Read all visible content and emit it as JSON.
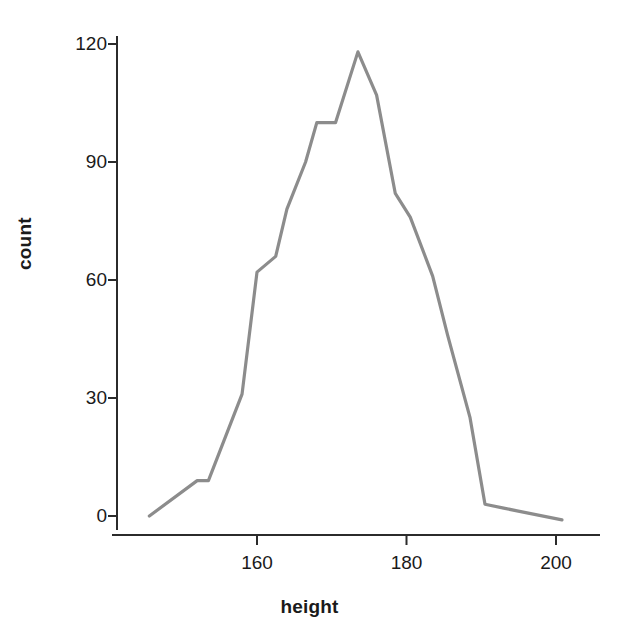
{
  "chart_data": {
    "type": "line",
    "title": "",
    "subtitle": "",
    "xlabel": "height",
    "ylabel": "count",
    "xlim": [
      144,
      202
    ],
    "ylim": [
      -2,
      122
    ],
    "grid": false,
    "legend": null,
    "line_color": "#8c8c8c",
    "axis_color": "#2b2b2b",
    "x_ticks": [
      160,
      180,
      200
    ],
    "y_ticks": [
      0,
      30,
      60,
      90,
      120
    ],
    "x_tick_labels": [
      "160",
      "180",
      "200"
    ],
    "y_tick_labels": [
      "0",
      "30",
      "60",
      "90",
      "120"
    ],
    "x": [
      145.6,
      152.0,
      153.5,
      158.0,
      160.0,
      162.5,
      164.0,
      166.5,
      168.0,
      170.5,
      173.5,
      176.0,
      178.5,
      180.5,
      183.5,
      185.5,
      188.5,
      190.5,
      193.0,
      200.8
    ],
    "values": [
      0,
      9,
      9,
      31,
      62,
      66,
      78,
      90,
      100,
      100,
      118,
      107,
      82,
      76,
      61,
      46,
      25,
      3,
      2,
      -1
    ],
    "series": [
      {
        "name": "count",
        "values": [
          0,
          9,
          9,
          31,
          62,
          66,
          78,
          90,
          100,
          100,
          118,
          107,
          82,
          76,
          61,
          46,
          25,
          3,
          2,
          -1
        ]
      }
    ]
  },
  "axes": {
    "y_label_text": "count",
    "x_label_text": "height"
  }
}
